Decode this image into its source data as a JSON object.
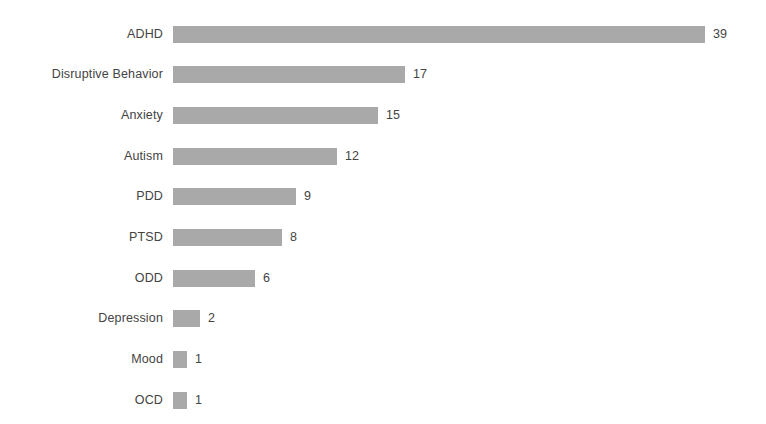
{
  "chart_data": {
    "type": "bar",
    "orientation": "horizontal",
    "title": "",
    "subtitle": "",
    "xlabel": "",
    "ylabel": "",
    "categories": [
      "ADHD",
      "Disruptive Behavior",
      "Anxiety",
      "Autism",
      "PDD",
      "PTSD",
      "ODD",
      "Depression",
      "Mood",
      "OCD"
    ],
    "values": [
      39,
      17,
      15,
      12,
      9,
      8,
      6,
      2,
      1,
      1
    ],
    "value_labels": [
      "39",
      "17",
      "15",
      "12",
      "9",
      "8",
      "6",
      "2",
      "1",
      "1"
    ],
    "xlim": [
      0,
      39
    ],
    "grid": false,
    "legend": false,
    "axis_lines": false,
    "tick_labels_x": [],
    "tick_labels_y": [
      "ADHD",
      "Disruptive Behavior",
      "Anxiety",
      "Autism",
      "PDD",
      "PTSD",
      "ODD",
      "Depression",
      "Mood",
      "OCD"
    ],
    "annotations": [],
    "colors": {
      "bar": "#a9a9a9",
      "text": "#434343",
      "background": "#ffffff"
    }
  }
}
